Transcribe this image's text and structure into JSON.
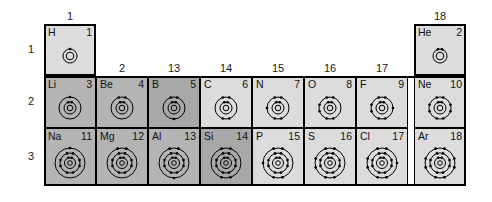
{
  "figure": {
    "kind": "periodic-table-bohr-diagrams",
    "periods": [
      "1",
      "2",
      "3"
    ],
    "group_labels": [
      {
        "group": "1",
        "col": 0
      },
      {
        "group": "2",
        "col": 1
      },
      {
        "group": "13",
        "col": 2
      },
      {
        "group": "14",
        "col": 3
      },
      {
        "group": "15",
        "col": 4
      },
      {
        "group": "16",
        "col": 5
      },
      {
        "group": "17",
        "col": 6
      },
      {
        "group": "18",
        "col": 7
      }
    ],
    "elements": [
      {
        "symbol": "H",
        "number": "1",
        "period": 1,
        "col": 0,
        "shade": "light",
        "shells": [
          1
        ]
      },
      {
        "symbol": "He",
        "number": "2",
        "period": 1,
        "col": 7,
        "shade": "light",
        "shells": [
          2
        ]
      },
      {
        "symbol": "Li",
        "number": "3",
        "period": 2,
        "col": 0,
        "shade": "mid",
        "shells": [
          2,
          1
        ]
      },
      {
        "symbol": "Be",
        "number": "4",
        "period": 2,
        "col": 1,
        "shade": "mid",
        "shells": [
          2,
          2
        ]
      },
      {
        "symbol": "B",
        "number": "5",
        "period": 2,
        "col": 2,
        "shade": "dark",
        "shells": [
          2,
          3
        ]
      },
      {
        "symbol": "C",
        "number": "6",
        "period": 2,
        "col": 3,
        "shade": "light",
        "shells": [
          2,
          4
        ]
      },
      {
        "symbol": "N",
        "number": "7",
        "period": 2,
        "col": 4,
        "shade": "light",
        "shells": [
          2,
          5
        ]
      },
      {
        "symbol": "O",
        "number": "8",
        "period": 2,
        "col": 5,
        "shade": "light",
        "shells": [
          2,
          6
        ]
      },
      {
        "symbol": "F",
        "number": "9",
        "period": 2,
        "col": 6,
        "shade": "light",
        "shells": [
          2,
          7
        ]
      },
      {
        "symbol": "Ne",
        "number": "10",
        "period": 2,
        "col": 7,
        "shade": "light",
        "shells": [
          2,
          8
        ]
      },
      {
        "symbol": "Na",
        "number": "11",
        "period": 3,
        "col": 0,
        "shade": "mid",
        "shells": [
          2,
          8,
          1
        ]
      },
      {
        "symbol": "Mg",
        "number": "12",
        "period": 3,
        "col": 1,
        "shade": "mid",
        "shells": [
          2,
          8,
          2
        ]
      },
      {
        "symbol": "Al",
        "number": "13",
        "period": 3,
        "col": 2,
        "shade": "mid",
        "shells": [
          2,
          8,
          3
        ]
      },
      {
        "symbol": "Si",
        "number": "14",
        "period": 3,
        "col": 3,
        "shade": "dark",
        "shells": [
          2,
          8,
          4
        ]
      },
      {
        "symbol": "P",
        "number": "15",
        "period": 3,
        "col": 4,
        "shade": "light",
        "shells": [
          2,
          8,
          5
        ]
      },
      {
        "symbol": "S",
        "number": "16",
        "period": 3,
        "col": 5,
        "shade": "light",
        "shells": [
          2,
          8,
          6
        ]
      },
      {
        "symbol": "Cl",
        "number": "17",
        "period": 3,
        "col": 6,
        "shade": "light",
        "shells": [
          2,
          8,
          7
        ]
      },
      {
        "symbol": "Ar",
        "number": "18",
        "period": 3,
        "col": 7,
        "shade": "light",
        "shells": [
          2,
          8,
          8
        ]
      }
    ],
    "colors": {
      "background": "#ffffff",
      "line": "#000000",
      "text": "#111111",
      "shade_light": "#dcdcdc",
      "shade_mid": "#b4b4b4",
      "shade_dark": "#a8a8a8"
    }
  }
}
